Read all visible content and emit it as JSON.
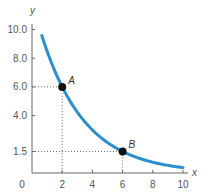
{
  "chart_data": {
    "type": "line",
    "title": "",
    "xlabel": "x",
    "ylabel": "y",
    "xlim": [
      0,
      10
    ],
    "ylim": [
      0,
      10
    ],
    "x_ticks": [
      2,
      4,
      6,
      8,
      10
    ],
    "y_ticks": [
      1.5,
      4.0,
      6.0,
      8.0,
      10.0
    ],
    "x_tick_labels": [
      "0",
      "2",
      "4",
      "6",
      "8",
      "10"
    ],
    "y_tick_labels": [
      "1.5",
      "4.0",
      "6.0",
      "8.0",
      "10.0"
    ],
    "grid": false,
    "series": [
      {
        "name": "curve",
        "color": "#2a8fce",
        "x": [
          0.5,
          1,
          2,
          3,
          4,
          5,
          6,
          7,
          8,
          9,
          10
        ],
        "y": [
          10.1,
          8.49,
          6.0,
          4.24,
          3.0,
          2.12,
          1.5,
          1.06,
          0.75,
          0.53,
          0.375
        ]
      }
    ],
    "points": [
      {
        "label": "A",
        "x": 2,
        "y": 6.0
      },
      {
        "label": "B",
        "x": 6,
        "y": 1.5
      }
    ],
    "annotations": [
      "dotted guide lines from A to x=2 and y=6.0",
      "dotted guide lines from B to x=6 and y=1.5"
    ]
  }
}
